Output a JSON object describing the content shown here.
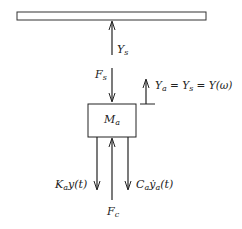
{
  "diagram": {
    "type": "free-body diagram",
    "ground_bar": {
      "label": ""
    },
    "mass": {
      "symbol": "M",
      "subscript": "a"
    },
    "labels": {
      "ys": {
        "main": "Y",
        "sub": "s"
      },
      "fs": {
        "main": "F",
        "sub": "s"
      },
      "ya_eq": {
        "text": "Y",
        "sub": "a",
        "rest": " = Y",
        "sub2": "s",
        "rest2": " = Y(ω)"
      },
      "ka": {
        "main": "K",
        "sub": "a",
        "rest": "y(t)"
      },
      "ca": {
        "main": "C",
        "sub": "a",
        "rest": "ẏ",
        "sub2": "a",
        "rest2": "(t)"
      },
      "fc": {
        "main": "F",
        "sub": "c"
      }
    },
    "colors": {
      "stroke": "#222222",
      "background": "#ffffff"
    }
  }
}
